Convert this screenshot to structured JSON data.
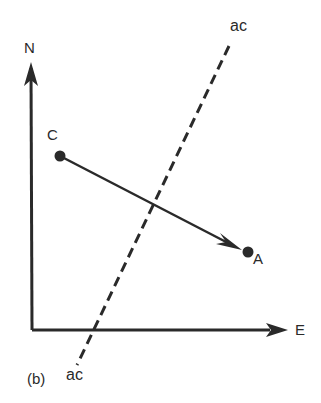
{
  "diagram": {
    "panel_label": "(b)",
    "axes": {
      "north_label": "N",
      "east_label": "E"
    },
    "points": {
      "start": {
        "label": "C"
      },
      "end": {
        "label": "A"
      }
    },
    "dashed_line": {
      "top_label": "ac",
      "bottom_label": "ac"
    },
    "colors": {
      "ink": "#2a2a2a",
      "background": "#ffffff"
    }
  }
}
